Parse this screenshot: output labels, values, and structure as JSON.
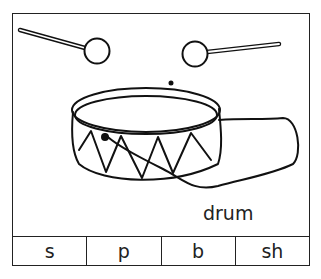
{
  "card": {
    "picture": "drum with two drumsticks",
    "word": "drum",
    "options": [
      {
        "label": "s"
      },
      {
        "label": "p"
      },
      {
        "label": "b"
      },
      {
        "label": "sh"
      }
    ]
  }
}
